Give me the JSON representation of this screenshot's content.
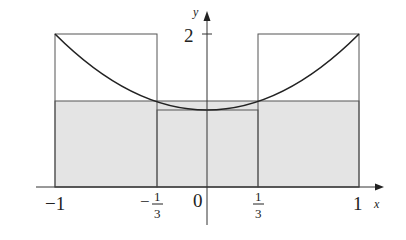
{
  "figure": {
    "function": "f(x) = 1 + x^2",
    "axes": {
      "x_label": "x",
      "y_label": "y",
      "x_ticks": [
        {
          "value": -1,
          "label": "−1"
        },
        {
          "value": -0.3333,
          "label_sign": "−",
          "label_num": "1",
          "label_den": "3"
        },
        {
          "value": 0,
          "label": "0"
        },
        {
          "value": 0.3333,
          "label_num": "1",
          "label_den": "3"
        },
        {
          "value": 1,
          "label": "1"
        }
      ],
      "y_ticks": [
        {
          "value": 2,
          "label": "2"
        }
      ]
    },
    "rectangles": [
      {
        "x_from": -1,
        "x_to": -0.3333,
        "height": 2
      },
      {
        "x_from": -0.3333,
        "x_to": 0.3333,
        "height": 1
      },
      {
        "x_from": 0.3333,
        "x_to": 1,
        "height": 2
      }
    ],
    "shaded_region": {
      "x_from": -1,
      "x_to": 1,
      "height": 1.1111
    },
    "colors": {
      "line": "#222222",
      "rect_stroke": "#555555",
      "shade": "#e4e4e4"
    }
  }
}
